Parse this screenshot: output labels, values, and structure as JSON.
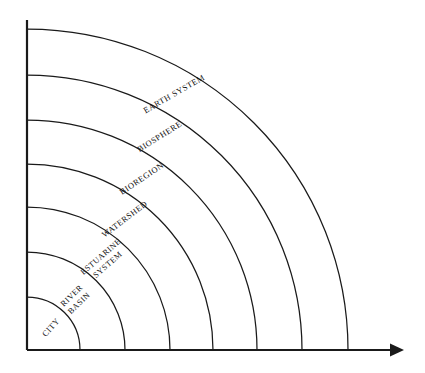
{
  "figure": {
    "background_color": "#ffffff",
    "line_color": "#1a1a1a",
    "text_color": "#111111",
    "origin": {
      "x": 27,
      "y": 350
    },
    "axes": {
      "vertical": {
        "name": "vertical-axis",
        "x": 27,
        "y_top": 20,
        "y_bottom": 350
      },
      "horizontal": {
        "name": "horizontal-axis",
        "y": 350,
        "x_left": 27,
        "x_right": 404,
        "arrow": true
      }
    },
    "rings": [
      {
        "id": "city",
        "label": "CITY",
        "radius": 53,
        "label_lines": [
          "CITY"
        ],
        "label_angle_deg": 42,
        "label_rotation_deg": -48,
        "label_radius": 33
      },
      {
        "id": "river-basin",
        "label": "RIVER BASIN",
        "radius": 98,
        "label_lines": [
          "RIVER",
          "BASIN"
        ],
        "label_angle_deg": 46,
        "label_rotation_deg": -44,
        "label_radius": 70
      },
      {
        "id": "estuarine-system",
        "label": "ESTUARINE SYSTEM",
        "radius": 143,
        "label_lines": [
          "ESTUARINE",
          "SYSTEM"
        ],
        "label_angle_deg": 49,
        "label_rotation_deg": -41,
        "label_radius": 118
      },
      {
        "id": "watershed",
        "label": "WATERSHED",
        "radius": 186,
        "label_lines": [
          "WATERSHED"
        ],
        "label_angle_deg": 53,
        "label_rotation_deg": -37,
        "label_radius": 163
      },
      {
        "id": "bioregion",
        "label": "BIOREGION",
        "radius": 230,
        "label_lines": [
          "BIOREGION"
        ],
        "label_angle_deg": 56,
        "label_rotation_deg": -34,
        "label_radius": 206
      },
      {
        "id": "biosphere",
        "label": "BIOSPHERE",
        "radius": 275,
        "label_lines": [
          "BIOSPHERE"
        ],
        "label_angle_deg": 58,
        "label_rotation_deg": -32,
        "label_radius": 251
      },
      {
        "id": "earth-system",
        "label": "EARTH SYSTEM",
        "radius": 321,
        "label_lines": [
          "EARTH SYSTEM"
        ],
        "label_angle_deg": 60,
        "label_rotation_deg": -30,
        "label_radius": 295
      }
    ]
  },
  "chart_data": {
    "type": "diagram",
    "subtype": "nested-quarter-arcs",
    "title": "",
    "xlabel": "",
    "ylabel": "",
    "categories": [
      "CITY",
      "RIVER BASIN",
      "ESTUARINE SYSTEM",
      "WATERSHED",
      "BIOREGION",
      "BIOSPHERE",
      "EARTH SYSTEM"
    ],
    "values": [
      53,
      98,
      143,
      186,
      230,
      275,
      321
    ],
    "value_units": "px radius from origin",
    "ordering": "innermost to outermost",
    "grid": false,
    "legend": "none"
  }
}
